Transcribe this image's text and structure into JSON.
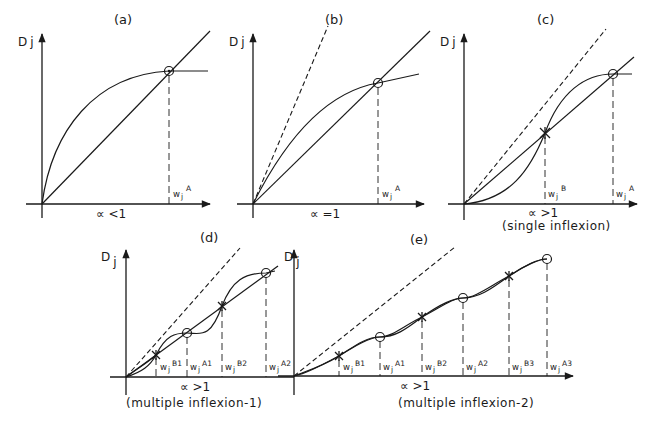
{
  "figure": {
    "axis_y_label": "D",
    "axis_y_sub": "j",
    "w_label": "w",
    "w_sub": "j",
    "panels": [
      {
        "id": "a",
        "title": "(a)",
        "condition": "∝ <1",
        "subtitle": "",
        "markers": [
          {
            "type": "circle",
            "label": "A"
          }
        ]
      },
      {
        "id": "b",
        "title": "(b)",
        "condition": "∝ =1",
        "subtitle": "",
        "markers": [
          {
            "type": "circle",
            "label": "A"
          }
        ]
      },
      {
        "id": "c",
        "title": "(c)",
        "condition": "∝ >1",
        "subtitle": "(single inflexion)",
        "markers": [
          {
            "type": "star",
            "label": "B"
          },
          {
            "type": "circle",
            "label": "A"
          }
        ]
      },
      {
        "id": "d",
        "title": "(d)",
        "condition": "∝ >1",
        "subtitle": "(multiple inflexion-1)",
        "markers": [
          {
            "type": "star",
            "label": "B1"
          },
          {
            "type": "circle",
            "label": "A1"
          },
          {
            "type": "star",
            "label": "B2"
          },
          {
            "type": "circle",
            "label": "A2"
          }
        ]
      },
      {
        "id": "e",
        "title": "(e)",
        "condition": "∝ >1",
        "subtitle": "(multiple inflexion-2)",
        "markers": [
          {
            "type": "star",
            "label": "B1"
          },
          {
            "type": "circle",
            "label": "A1"
          },
          {
            "type": "star",
            "label": "B2"
          },
          {
            "type": "circle",
            "label": "A2"
          },
          {
            "type": "star",
            "label": "B3"
          },
          {
            "type": "circle",
            "label": "A3"
          }
        ]
      }
    ]
  }
}
